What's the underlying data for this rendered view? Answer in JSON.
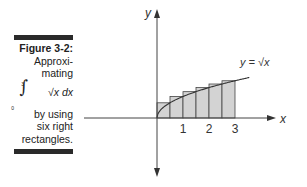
{
  "caption": {
    "figure_label": "Figure 3-2:",
    "line1": "Approxi-",
    "line2": "mating",
    "integral_upper": "3",
    "integral_lower": "0",
    "integral_sign": "∫",
    "integrand": "√x dx",
    "line3": "by using",
    "line4": "six right",
    "line5": "rectangles."
  },
  "chart_data": {
    "type": "area",
    "title": "",
    "xlabel": "x",
    "ylabel": "y",
    "curve_label": "y = √x",
    "function": "sqrt(x)",
    "x_ticks": [
      "1",
      "2",
      "3"
    ],
    "x_tick_values": [
      1,
      2,
      3
    ],
    "xlim": [
      -2.6,
      3.7
    ],
    "ylim": [
      -1.7,
      2.6
    ],
    "grid": false,
    "rectangles": {
      "method": "right",
      "count": 6,
      "width": 0.5,
      "x_left": [
        0,
        0.5,
        1,
        1.5,
        2,
        2.5
      ],
      "heights": [
        0.707,
        1.0,
        1.225,
        1.414,
        1.581,
        1.732
      ],
      "fill": "#d3d3d3"
    }
  }
}
